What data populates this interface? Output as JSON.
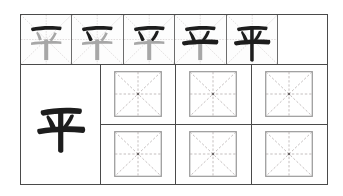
{
  "worksheet": {
    "type": "chinese-character-writing-practice",
    "character": "平",
    "grid_style": "mi-zi-ge",
    "colors": {
      "frame": "#4a4a4a",
      "cell_divider": "#6d6d6d",
      "guide_line": "#b9b3b3",
      "ink": "#1d1d1d",
      "ink_faded": "#9b9b9b",
      "page": "#ffffff"
    },
    "stroke_order_row": {
      "label": "stroke-order-demonstration",
      "total_cells": 6,
      "filled_cells": 5,
      "blank_cells": 1,
      "steps": [
        {
          "index": 1,
          "strokes_shown": 1,
          "new_stroke": "heng-top",
          "faded_remainder": true
        },
        {
          "index": 2,
          "strokes_shown": 2,
          "new_stroke": "dian-left",
          "faded_remainder": true
        },
        {
          "index": 3,
          "strokes_shown": 3,
          "new_stroke": "dian-right",
          "faded_remainder": true
        },
        {
          "index": 4,
          "strokes_shown": 4,
          "new_stroke": "heng-long",
          "faded_remainder": true
        },
        {
          "index": 5,
          "strokes_shown": 5,
          "new_stroke": "shu-vertical",
          "faded_remainder": false
        }
      ]
    },
    "model_cell": {
      "label": "model-character",
      "character": "平"
    },
    "practice_grid": {
      "label": "blank-practice-boxes",
      "rows": 2,
      "columns": 3,
      "cells": [
        {
          "id": "r1c1",
          "character": ""
        },
        {
          "id": "r1c2",
          "character": ""
        },
        {
          "id": "r1c3",
          "character": ""
        },
        {
          "id": "r2c1",
          "character": ""
        },
        {
          "id": "r2c2",
          "character": ""
        },
        {
          "id": "r2c3",
          "character": ""
        }
      ]
    }
  }
}
